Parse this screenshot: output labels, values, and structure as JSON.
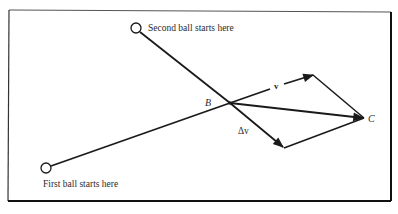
{
  "diagram": {
    "labels": {
      "second_ball": "Second ball starts here",
      "first_ball": "First ball starts here",
      "point_b": "B",
      "point_c": "C",
      "velocity": "v",
      "delta_velocity": "Δv"
    },
    "colors": {
      "line": "#1a1a1a",
      "frame": "#1a1a1a",
      "background": "#ffffff"
    }
  }
}
